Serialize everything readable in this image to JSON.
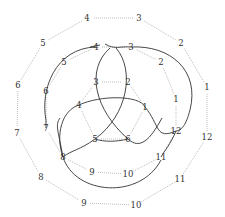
{
  "diagram": {
    "type": "knot-diagram-with-labeled-polygons",
    "colors": {
      "knot_strand": "#333333",
      "dotted_edges": "#bdbdbd",
      "labels": "#333333"
    },
    "outer_ring": {
      "labels": [
        "1",
        "2",
        "3",
        "4",
        "5",
        "6",
        "7",
        "8",
        "9",
        "10",
        "11",
        "12"
      ],
      "positions": [
        [
          207,
          87
        ],
        [
          181,
          43
        ],
        [
          139,
          18
        ],
        [
          87,
          18
        ],
        [
          43,
          43
        ],
        [
          18,
          85
        ],
        [
          17,
          133
        ],
        [
          41,
          177
        ],
        [
          84,
          203
        ],
        [
          136,
          205
        ],
        [
          180,
          179
        ],
        [
          207,
          137
        ]
      ]
    },
    "middle_ring": {
      "labels": [
        "1",
        "2",
        "3",
        "4",
        "5",
        "6",
        "7",
        "8",
        "9",
        "10",
        "11",
        "12"
      ],
      "positions": [
        [
          176,
          99
        ],
        [
          161,
          62
        ],
        [
          131,
          47
        ],
        [
          96,
          47
        ],
        [
          64,
          62
        ],
        [
          46,
          91
        ],
        [
          46,
          128
        ],
        [
          63,
          157
        ],
        [
          92,
          172
        ],
        [
          128,
          174
        ],
        [
          161,
          157
        ],
        [
          176,
          131
        ]
      ]
    },
    "inner_ring": {
      "labels": [
        "1",
        "2",
        "3",
        "4",
        "5",
        "6"
      ],
      "positions": [
        [
          145,
          107
        ],
        [
          128,
          82
        ],
        [
          96,
          82
        ],
        [
          79,
          105
        ],
        [
          95,
          139
        ],
        [
          128,
          139
        ]
      ]
    }
  }
}
